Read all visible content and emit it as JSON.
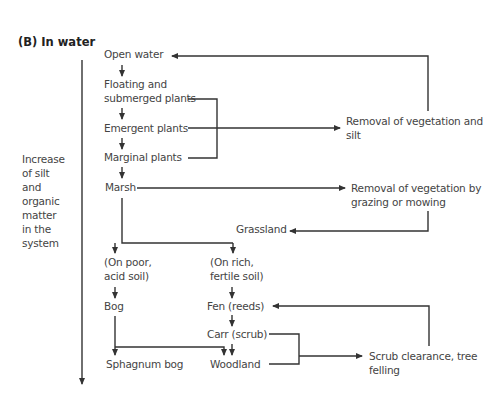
{
  "title": "(B) In water",
  "side_label": [
    "Increase",
    "of silt",
    "and",
    "organic",
    "matter",
    "in the",
    "system"
  ],
  "nodes": {
    "open_water": "Open water",
    "floating": [
      "Floating and",
      "submerged plants"
    ],
    "emergent": "Emergent plants",
    "marginal": "Marginal plants",
    "marsh": "Marsh",
    "removal_silt": [
      "Removal of vegetation and",
      "silt"
    ],
    "removal_grazing": [
      "Removal of vegetation by",
      "grazing or mowing"
    ],
    "grassland": "Grassland",
    "poor_soil": [
      "(On poor,",
      "acid soil)"
    ],
    "rich_soil": [
      "(On rich,",
      "fertile soil)"
    ],
    "bog": "Bog",
    "fen": "Fen (reeds)",
    "carr": "Carr (scrub)",
    "sphagnum": "Sphagnum bog",
    "woodland": "Woodland",
    "scrub_clearance": [
      "Scrub clearance, tree",
      "felling"
    ]
  }
}
